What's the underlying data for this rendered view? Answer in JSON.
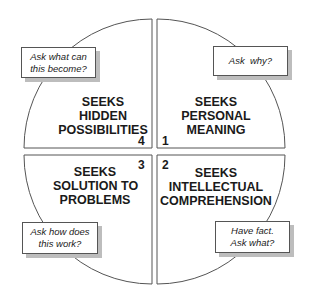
{
  "quadrants": [
    {
      "number": "1",
      "heading": [
        "SEEKS",
        "PERSONAL",
        "MEANING"
      ],
      "callout": [
        "Ask  why?"
      ]
    },
    {
      "number": "2",
      "heading": [
        "SEEKS",
        "INTELLECTUAL",
        "COMPREHENSION"
      ],
      "callout": [
        "Have fact.",
        "Ask what?"
      ]
    },
    {
      "number": "3",
      "heading": [
        "SEEKS",
        "SOLUTION TO",
        "PROBLEMS"
      ],
      "callout": [
        "Ask how does",
        "this work?"
      ]
    },
    {
      "number": "4",
      "heading": [
        "SEEKS",
        "HIDDEN",
        "POSSIBILITIES"
      ],
      "callout": [
        "Ask what can",
        "this become?"
      ]
    }
  ],
  "colors": {
    "outline": "#555555",
    "shadow": "#bdbdbd",
    "text": "#1a1a1a"
  }
}
